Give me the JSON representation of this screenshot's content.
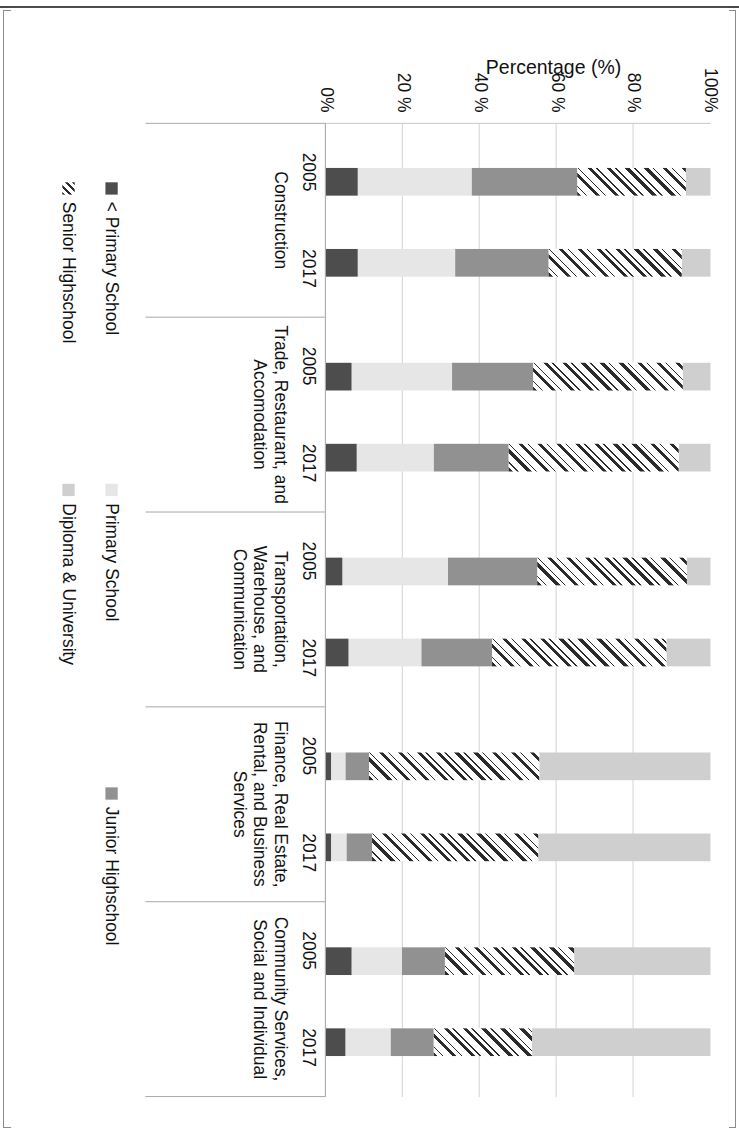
{
  "chart_data": {
    "type": "bar",
    "subtype": "stacked-bar-100-percent-horizontal-rotated",
    "title": "",
    "xlabel": "",
    "ylabel": "Percentage (%)",
    "ylim": [
      0,
      100
    ],
    "ytick_labels": [
      "0%",
      "20 %",
      "40 %",
      "60 %",
      "80 %",
      "100%"
    ],
    "ytick_values": [
      0,
      20,
      40,
      60,
      80,
      100
    ],
    "grid": true,
    "legend_position": "bottom",
    "orientation": "rotated-90-clockwise",
    "categories": [
      "Construction",
      "Trade, Restaurant, and Accomodation",
      "Transportation, Warehouse, and Communication",
      "Finance, Real Estate, Rental, and Business Services",
      "Community Services, Social and Individual"
    ],
    "subcategories": [
      "2005",
      "2017"
    ],
    "series": [
      {
        "name": "< Primary School",
        "color": "#4d4d4d",
        "values": [
          {
            "category": "Construction",
            "2005": 8.4,
            "2017": 8.4
          },
          {
            "category": "Trade, Restaurant, and Accomodation",
            "2005": 6.6,
            "2017": 8.1
          },
          {
            "category": "Transportation, Warehouse, and Communication",
            "2005": 4.4,
            "2017": 5.8
          },
          {
            "category": "Finance, Real Estate, Rental, and Business Services",
            "2005": 1.3,
            "2017": 1.4
          },
          {
            "category": "Community Services, Social and Individual",
            "2005": 6.6,
            "2017": 5.2
          }
        ]
      },
      {
        "name": "Primary School",
        "color": "#e6e6e6",
        "values": [
          {
            "category": "Construction",
            "2005": 29.5,
            "2017": 25.3
          },
          {
            "category": "Trade, Restaurant, and Accomodation",
            "2005": 26.3,
            "2017": 20.0
          },
          {
            "category": "Transportation, Warehouse, and Communication",
            "2005": 27.4,
            "2017": 19.0
          },
          {
            "category": "Finance, Real Estate, Rental, and Business Services",
            "2005": 3.7,
            "2017": 3.9
          },
          {
            "category": "Community Services, Social and Individual",
            "2005": 13.2,
            "2017": 11.6
          }
        ]
      },
      {
        "name": "Junior Highschool",
        "color": "#919191",
        "values": [
          {
            "category": "Construction",
            "2005": 27.4,
            "2017": 24.2
          },
          {
            "category": "Trade, Restaurant, and Accomodation",
            "2005": 21.1,
            "2017": 19.5
          },
          {
            "category": "Transportation, Warehouse, and Communication",
            "2005": 23.2,
            "2017": 18.4
          },
          {
            "category": "Finance, Real Estate, Rental, and Business Services",
            "2005": 6.3,
            "2017": 6.8
          },
          {
            "category": "Community Services, Social and Individual",
            "2005": 11.1,
            "2017": 11.1
          }
        ]
      },
      {
        "name": "Senior Highschool",
        "color": "#2b2b2b",
        "pattern": "diagonal-hatch",
        "values": [
          {
            "category": "Construction",
            "2005": 28.4,
            "2017": 34.7
          },
          {
            "category": "Trade, Restaurant, and Accomodation",
            "2005": 38.9,
            "2017": 44.2
          },
          {
            "category": "Transportation, Warehouse, and Communication",
            "2005": 39.0,
            "2017": 45.3
          },
          {
            "category": "Finance, Real Estate, Rental, and Business Services",
            "2005": 44.2,
            "2017": 43.2
          },
          {
            "category": "Community Services, Social and Individual",
            "2005": 33.7,
            "2017": 25.8
          }
        ]
      },
      {
        "name": "Diploma & University",
        "color": "#cfcfcf",
        "values": [
          {
            "category": "Construction",
            "2005": 6.3,
            "2017": 7.4
          },
          {
            "category": "Trade, Restaurant, and Accomodation",
            "2005": 7.1,
            "2017": 8.2
          },
          {
            "category": "Transportation, Warehouse, and Communication",
            "2005": 6.0,
            "2017": 11.5
          },
          {
            "category": "Finance, Real Estate, Rental, and Business Services",
            "2005": 44.5,
            "2017": 44.7
          },
          {
            "category": "Community Services, Social and Individual",
            "2005": 35.4,
            "2017": 46.3
          }
        ]
      }
    ]
  },
  "axis": {
    "value_title": "Percentage (%)",
    "ticks": [
      "100%",
      "80 %",
      "60 %",
      "40 %",
      "20 %",
      "0%"
    ]
  },
  "legend": {
    "items": [
      {
        "label": "< Primary School",
        "swatch": "s-lessprim"
      },
      {
        "label": "Primary School",
        "swatch": "s-primary"
      },
      {
        "label": "Junior Highschool",
        "swatch": "s-junior"
      },
      {
        "label": "Senior Highschool",
        "swatch": "s-senior"
      },
      {
        "label": "Diploma & University",
        "swatch": "s-diploma"
      }
    ]
  },
  "groups": [
    {
      "name": "Construction",
      "years": [
        "2005",
        "2017"
      ]
    },
    {
      "name": "Trade, Restaurant, and Accomodation",
      "years": [
        "2005",
        "2017"
      ]
    },
    {
      "name": "Transportation, Warehouse, and Communication",
      "years": [
        "2005",
        "2017"
      ]
    },
    {
      "name": "Finance, Real Estate, Rental, and Business Services",
      "years": [
        "2005",
        "2017"
      ]
    },
    {
      "name": "Community Services, Social and Individual",
      "years": [
        "2005",
        "2017"
      ]
    }
  ]
}
